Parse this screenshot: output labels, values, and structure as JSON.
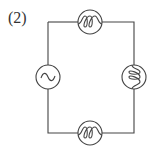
{
  "figure": {
    "label": "(2)",
    "components": [
      {
        "type": "ac-source",
        "position": "left",
        "symbol": "~"
      },
      {
        "type": "lamp",
        "position": "top"
      },
      {
        "type": "lamp",
        "position": "right"
      },
      {
        "type": "lamp",
        "position": "bottom"
      }
    ],
    "colors": {
      "stroke": "#444444",
      "background": "#ffffff"
    }
  }
}
